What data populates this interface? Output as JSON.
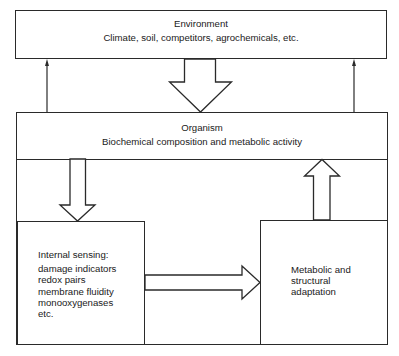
{
  "diagram": {
    "environment": {
      "title": "Environment",
      "subtitle": "Climate, soil, competitors, agrochemicals, etc."
    },
    "organism": {
      "title": "Organism",
      "subtitle": "Biochemical composition and metabolic activity"
    },
    "internal_sensing": {
      "heading": "Internal sensing:",
      "items": [
        "damage indicators",
        "redox pairs",
        "membrane fluidity",
        "monooxygenases",
        "etc."
      ]
    },
    "adaptation": {
      "lines": [
        "Metabolic and",
        "structural",
        "adaptation"
      ]
    },
    "arrows": [
      {
        "from": "environment",
        "to": "organism",
        "style": "block"
      },
      {
        "from": "organism",
        "to": "environment",
        "style": "thin",
        "side": "left"
      },
      {
        "from": "organism",
        "to": "environment",
        "style": "thin",
        "side": "right"
      },
      {
        "from": "organism",
        "to": "internal_sensing",
        "style": "block"
      },
      {
        "from": "internal_sensing",
        "to": "adaptation",
        "style": "block"
      },
      {
        "from": "adaptation",
        "to": "organism",
        "style": "block"
      }
    ],
    "colors": {
      "stroke": "#2a2a2a",
      "background": "#ffffff",
      "text": "#1a1a1a"
    }
  }
}
